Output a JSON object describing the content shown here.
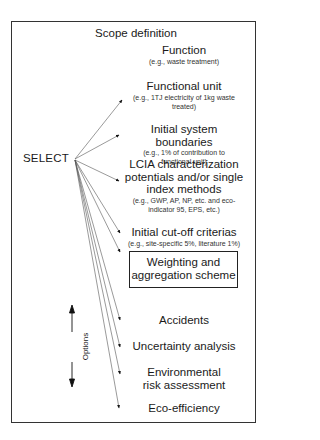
{
  "diagram": {
    "title": "Scope definition",
    "source_label": "SELECT",
    "options_label": "Options",
    "items": [
      {
        "main": "Function",
        "sub": "(e.g., waste treatment)"
      },
      {
        "main": "Functional unit",
        "sub": "(e.g., 1TJ electricity of 1kg waste treated)"
      },
      {
        "main": "Initial system boundaries",
        "sub": "(e.g., 1% of contribution to functional unit)"
      },
      {
        "main": "LCIA characterization potentials and/or single index methods",
        "sub": "(e.g., GWP, AP, NP, etc. and eco-indicator 95, EPS, etc.)"
      },
      {
        "main": "Initial cut-off criterias",
        "sub": "(e.g., site-specific 5%, literature 1%)"
      },
      {
        "main": "Weighting and aggregation scheme",
        "sub": ""
      },
      {
        "main": "Accidents",
        "sub": ""
      },
      {
        "main": "Uncertainty analysis",
        "sub": ""
      },
      {
        "main": "Environmental risk assessment",
        "sub": ""
      },
      {
        "main": "Eco-efficiency",
        "sub": ""
      }
    ]
  }
}
